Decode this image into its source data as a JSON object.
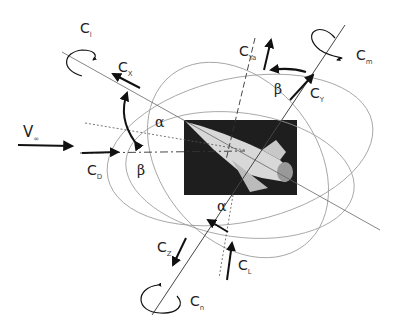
{
  "diagram": {
    "labels": {
      "c_l_roll": {
        "main": "C",
        "sub": "l"
      },
      "c_x": {
        "main": "C",
        "sub": "X"
      },
      "c_ya": {
        "main": "C",
        "sub": "Ya"
      },
      "c_m": {
        "main": "C",
        "sub": "m"
      },
      "c_y": {
        "main": "C",
        "sub": "Y"
      },
      "v_inf": {
        "main": "V",
        "sub": "∞"
      },
      "c_d": {
        "main": "C",
        "sub": "D"
      },
      "c_z": {
        "main": "C",
        "sub": "Z"
      },
      "c_lift": {
        "main": "C",
        "sub": "L"
      },
      "c_n": {
        "main": "C",
        "sub": "n"
      },
      "alpha_top": "α",
      "alpha_bottom": "α",
      "beta_top": "β",
      "beta_left": "β"
    },
    "colors": {
      "ink": "#111111",
      "thin_line": "#888888",
      "image_bg": "#1e1e1e",
      "vehicle": "#d8d8d8"
    }
  }
}
